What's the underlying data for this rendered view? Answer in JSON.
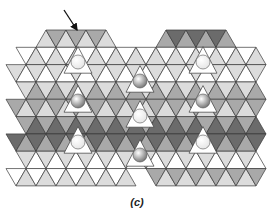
{
  "figure": {
    "caption": "(c)",
    "colors": {
      "light": "#dcdcdc",
      "mid": "#a9a9a9",
      "dark": "#6b6b6b",
      "white": "#ffffff",
      "edge": "#3a3a3a",
      "sphere_light": "#e6e6e6",
      "sphere_dark": "#7a7a7a"
    },
    "arrow": {
      "x1": 64,
      "y1": 10,
      "x2": 77,
      "y2": 30
    },
    "spheres": [
      {
        "x": 78,
        "y": 62,
        "r": 7,
        "tone": "light"
      },
      {
        "x": 203,
        "y": 62,
        "r": 7,
        "tone": "light"
      },
      {
        "x": 78,
        "y": 101,
        "r": 7,
        "tone": "dark"
      },
      {
        "x": 203,
        "y": 101,
        "r": 7,
        "tone": "dark"
      },
      {
        "x": 78,
        "y": 142,
        "r": 7,
        "tone": "light"
      },
      {
        "x": 203,
        "y": 142,
        "r": 7,
        "tone": "light"
      },
      {
        "x": 140,
        "y": 81,
        "r": 7,
        "tone": "dark"
      },
      {
        "x": 140,
        "y": 116,
        "r": 7,
        "tone": "light"
      },
      {
        "x": 140,
        "y": 155,
        "r": 7,
        "tone": "dark"
      }
    ]
  }
}
